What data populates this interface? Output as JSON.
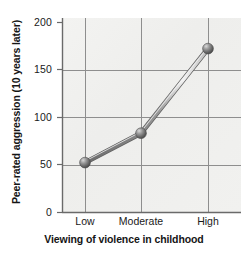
{
  "chart_data": {
    "type": "line",
    "title": "",
    "xlabel": "Viewing of violence in childhood",
    "ylabel": "Peer-rated aggression (10 years later)",
    "categories": [
      "Low",
      "Moderate",
      "High"
    ],
    "values": [
      52,
      83,
      172
    ],
    "series": [
      {
        "name": "Peer-rated aggression",
        "values": [
          52,
          83,
          172
        ]
      }
    ],
    "ylim": [
      0,
      200
    ],
    "yticks": [
      "0",
      "50",
      "100",
      "150",
      "200"
    ],
    "ytick_values": [
      0,
      50,
      100,
      150,
      200
    ],
    "xticks": [
      "Low",
      "Moderate",
      "High"
    ],
    "grid": true,
    "legend": "none",
    "marker": "sphere",
    "line_color": "#8c8c8c",
    "marker_color": "#6e6e6e",
    "grid_color": "#8e8e8e",
    "plot_background": "#f0f0ee",
    "figure_background": "#ffffff"
  },
  "axis": {
    "y_title": "Peer-rated aggression (10 years later)",
    "x_title": "Viewing of violence in childhood",
    "y_tick_labels": [
      "200",
      "150",
      "100",
      "50",
      "0"
    ],
    "x_tick_labels": [
      "Low",
      "Moderate",
      "High"
    ]
  }
}
